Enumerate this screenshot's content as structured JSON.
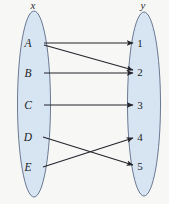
{
  "diagram": {
    "type": "mapping-diagram",
    "title": "",
    "domain_set": {
      "label": "x",
      "label_x": 33,
      "label_y": 9,
      "ellipse": {
        "cx": 34,
        "cy": 104,
        "rx": 16.5,
        "ry": 93
      },
      "nodes": [
        {
          "id": "A",
          "label": "A",
          "x": 28,
          "y": 47
        },
        {
          "id": "B",
          "label": "B",
          "x": 28,
          "y": 77
        },
        {
          "id": "C",
          "label": "C",
          "x": 28,
          "y": 109
        },
        {
          "id": "D",
          "label": "D",
          "x": 28,
          "y": 141
        },
        {
          "id": "E",
          "label": "E",
          "x": 28,
          "y": 171
        }
      ]
    },
    "codomain_set": {
      "label": "y",
      "label_x": 143,
      "label_y": 9,
      "ellipse": {
        "cx": 144,
        "cy": 104,
        "rx": 16.5,
        "ry": 92
      },
      "nodes": [
        {
          "id": "1",
          "label": "1",
          "x": 140,
          "y": 47
        },
        {
          "id": "2",
          "label": "2",
          "x": 140,
          "y": 76
        },
        {
          "id": "3",
          "label": "3",
          "x": 140,
          "y": 109
        },
        {
          "id": "4",
          "label": "4",
          "x": 140,
          "y": 141
        },
        {
          "id": "5",
          "label": "5",
          "x": 140,
          "y": 170
        }
      ]
    },
    "edges": [
      {
        "from": "A",
        "to": "1",
        "x1": 44,
        "y1": 43,
        "x2": 133,
        "y2": 43
      },
      {
        "from": "A",
        "to": "2",
        "x1": 44,
        "y1": 45,
        "x2": 133,
        "y2": 70
      },
      {
        "from": "B",
        "to": "2",
        "x1": 44,
        "y1": 73,
        "x2": 133,
        "y2": 73
      },
      {
        "from": "C",
        "to": "3",
        "x1": 44,
        "y1": 105,
        "x2": 133,
        "y2": 105
      },
      {
        "from": "D",
        "to": "5",
        "x1": 43,
        "y1": 137,
        "x2": 133,
        "y2": 165
      },
      {
        "from": "E",
        "to": "4",
        "x1": 43,
        "y1": 167,
        "x2": 133,
        "y2": 138
      }
    ]
  },
  "colors": {
    "set_fill": "#d7e5f3",
    "set_stroke": "#5a6b84",
    "edge": "#24242c",
    "background": "#f7f7f5",
    "text": "#1d1d24"
  }
}
